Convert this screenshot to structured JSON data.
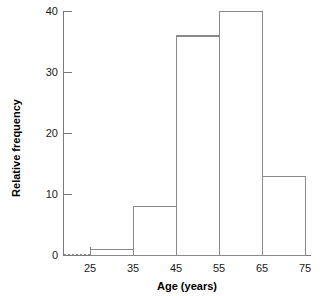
{
  "chart_data": {
    "type": "bar",
    "title": "",
    "subtitle": "",
    "xlabel": "Age (years)",
    "ylabel": "Relative frequency",
    "categories": [
      "25-35",
      "35-45",
      "45-55",
      "55-65",
      "65-75"
    ],
    "values": [
      1,
      8,
      36,
      40,
      13
    ],
    "bin_edges": [
      25,
      35,
      45,
      55,
      65,
      75
    ],
    "bin_width": 10,
    "xlim": [
      20,
      75
    ],
    "ylim": [
      0,
      40
    ],
    "x_ticks": [
      25,
      35,
      45,
      55,
      65,
      75
    ],
    "x_tick_labels": [
      "25",
      "35",
      "45",
      "55",
      "65",
      "75"
    ],
    "y_ticks": [
      0,
      10,
      20,
      30,
      40
    ],
    "y_tick_labels": [
      "0",
      "10",
      "20",
      "30",
      "40"
    ],
    "grid": false,
    "legend": false,
    "legend_position": "none",
    "bar_fill_color": "#ffffff",
    "bar_edge_color": "#8a8a8a",
    "axis_color": "#7a7a7a",
    "text_color": "#1a1a1a",
    "background_color": "#ffffff",
    "annotations": [
      {
        "name": "baseline-leader",
        "description": "dotted horizontal segment along baseline from y-axis to first bin edge",
        "from_x": 20,
        "to_x": 25,
        "y": 0
      }
    ]
  },
  "axes": {
    "y_title": "Relative frequency",
    "x_title": "Age (years)"
  }
}
